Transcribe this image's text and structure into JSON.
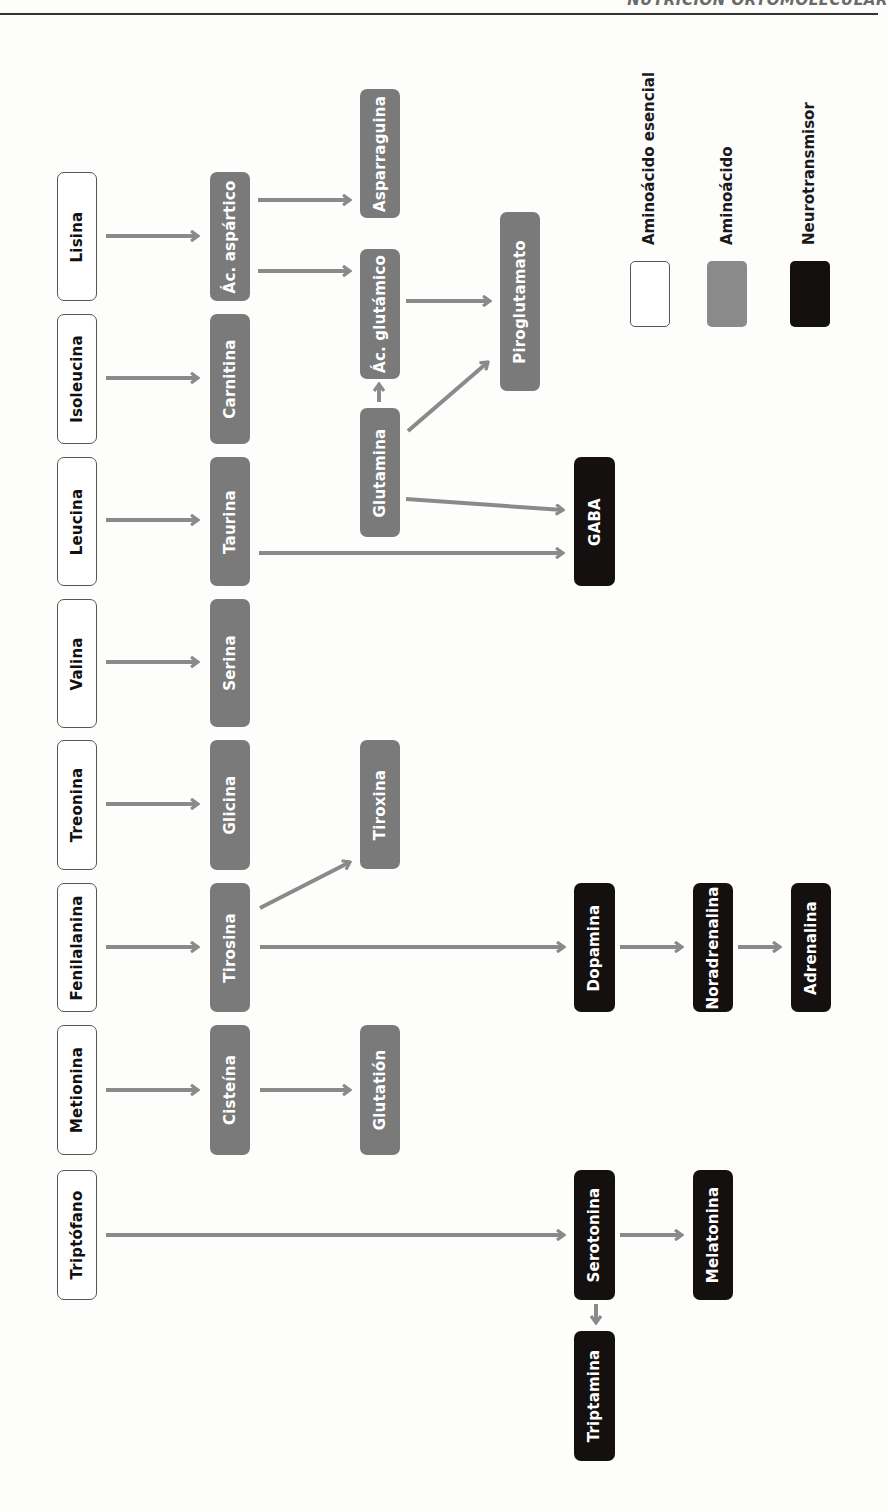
{
  "header": {
    "running_title": "NUTRICIÓN ORTOMOLECULAR"
  },
  "legend": {
    "essential": "Aminoácido esencial",
    "amino": "Aminoácido",
    "neuro": "Neurotransmisor"
  },
  "colors": {
    "essential_fill": "#ffffff",
    "amino_fill": "#7a7a7a",
    "neuro_fill": "#141010",
    "arrow": "#8a8a8a"
  },
  "nodes": {
    "lisina": "Lisina",
    "isoleucina": "Isoleucina",
    "leucina": "Leucina",
    "valina": "Valina",
    "treonina": "Treonina",
    "fenilalanina": "Fenilalanina",
    "metionina": "Metionina",
    "triptofano": "Triptófano",
    "ac_aspartico": "Ác. aspártico",
    "carnitina": "Carnitina",
    "taurina": "Taurina",
    "serina": "Serina",
    "glicina": "Glicina",
    "tirosina": "Tirosina",
    "cisteina": "Cisteína",
    "asparraguina": "Asparraguina",
    "ac_glutamico": "Ác. glutámico",
    "glutamina": "Glutamina",
    "tiroxina": "Tiroxina",
    "glutation": "Glutatión",
    "piroglutamato": "Piroglutamato",
    "gaba": "GABA",
    "dopamina": "Dopamina",
    "serotonina": "Serotonina",
    "triptamina": "Triptamina",
    "noradrenalina": "Noradrenalina",
    "melatonina": "Melatonina",
    "adrenalina": "Adrenalina"
  },
  "edges": [
    [
      "Lisina",
      "Ác. aspártico"
    ],
    [
      "Ác. aspártico",
      "Asparraguina"
    ],
    [
      "Ác. aspártico",
      "Ác. glutámico"
    ],
    [
      "Ác. glutámico",
      "Piroglutamato"
    ],
    [
      "Isoleucina",
      "Carnitina"
    ],
    [
      "Glutamina",
      "Ác. glutámico"
    ],
    [
      "Glutamina",
      "Piroglutamato"
    ],
    [
      "Glutamina",
      "GABA"
    ],
    [
      "Leucina",
      "Taurina"
    ],
    [
      "Taurina",
      "GABA"
    ],
    [
      "Valina",
      "Serina"
    ],
    [
      "Treonina",
      "Glicina"
    ],
    [
      "Fenilalanina",
      "Tirosina"
    ],
    [
      "Tirosina",
      "Tiroxina"
    ],
    [
      "Tirosina",
      "Dopamina"
    ],
    [
      "Dopamina",
      "Noradrenalina"
    ],
    [
      "Noradrenalina",
      "Adrenalina"
    ],
    [
      "Metionina",
      "Cisteína"
    ],
    [
      "Cisteína",
      "Glutatión"
    ],
    [
      "Triptófano",
      "Serotonina"
    ],
    [
      "Serotonina",
      "Melatonina"
    ],
    [
      "Serotonina",
      "Triptamina"
    ]
  ]
}
